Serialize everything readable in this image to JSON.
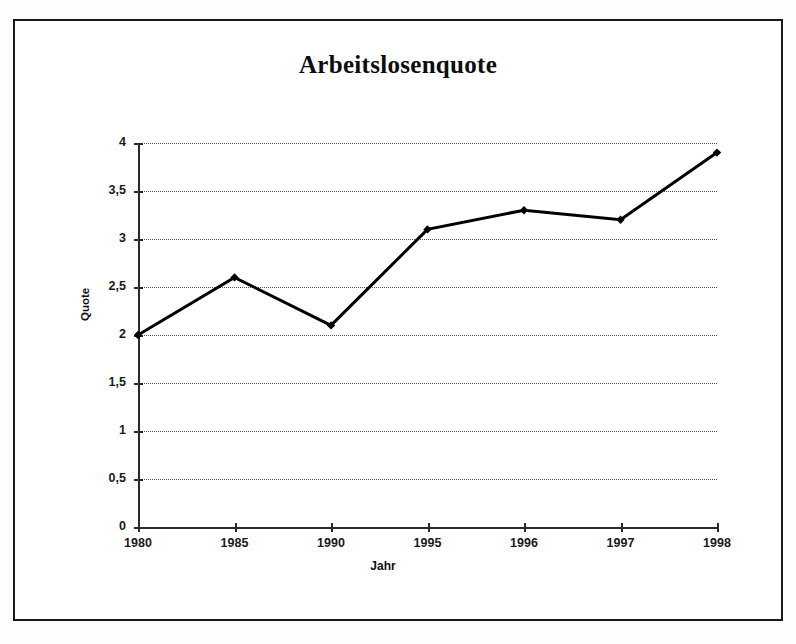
{
  "figure": {
    "title": "Arbeitslosenquote",
    "frame_color": "#1a1a1a",
    "background": "#ffffff"
  },
  "chart_data": {
    "type": "line",
    "title": "Arbeitslosenquote",
    "xlabel": "Jahr",
    "ylabel": "Quote",
    "categories": [
      "1980",
      "1985",
      "1990",
      "1995",
      "1996",
      "1997",
      "1998"
    ],
    "values": [
      2.0,
      2.6,
      2.1,
      3.1,
      3.3,
      3.2,
      3.9
    ],
    "series": [
      {
        "name": "Arbeitslosenquote",
        "values": [
          2.0,
          2.6,
          2.1,
          3.1,
          3.3,
          3.2,
          3.9
        ]
      }
    ],
    "ylim": [
      0,
      4
    ],
    "ytick_labels": [
      "0",
      "0,5",
      "1",
      "1,5",
      "2",
      "2,5",
      "3",
      "3,5",
      "4"
    ],
    "ytick_values": [
      0,
      0.5,
      1,
      1.5,
      2,
      2.5,
      3,
      3.5,
      4
    ],
    "xtick_labels": [
      "1980",
      "1985",
      "1990",
      "1995",
      "1996",
      "1997",
      "1998"
    ],
    "grid": true,
    "grid_axis": "y",
    "grid_style": "dotted",
    "grid_color": "#555555",
    "line_color": "#000000",
    "line_width": 3,
    "marker": "diamond",
    "marker_color": "#000000",
    "legend": false,
    "legend_position": "none"
  }
}
